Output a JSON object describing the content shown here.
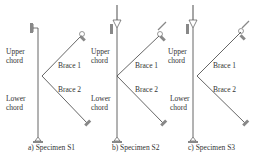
{
  "panels": [
    {
      "caption": "a) Specimen S1",
      "upper": "Upper",
      "upper2": "chord",
      "lower": "Lower",
      "lower2": "chord",
      "brace1": "Brace 1",
      "brace2": "Brace 2",
      "axial_load": false
    },
    {
      "caption": "b) Specimen S2",
      "upper": "Upper",
      "upper2": "chord",
      "lower": "Lower",
      "lower2": "chord",
      "brace1": "Brace 1",
      "brace2": "Brace 2",
      "axial_load": true
    },
    {
      "caption": "c) Specimen S3",
      "upper": "Upper",
      "upper2": "chord",
      "lower": "Lower",
      "lower2": "chord",
      "brace1": "Brace 1",
      "brace2": "Brace 2",
      "axial_load": true
    }
  ],
  "colors": {
    "line": "#555555",
    "text": "#333333"
  }
}
